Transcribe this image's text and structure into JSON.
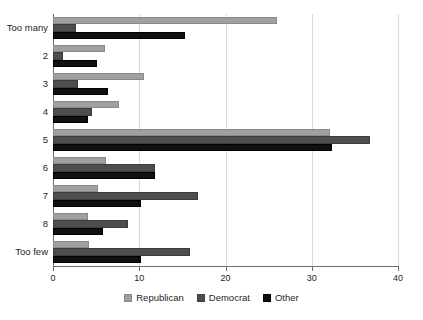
{
  "chart_data": {
    "type": "bar",
    "orientation": "horizontal",
    "grouped": true,
    "title": "",
    "subtitle": "",
    "xlabel": "",
    "ylabel": "",
    "xlim": [
      0,
      40
    ],
    "ylim": null,
    "grid": true,
    "grid_axis": "x",
    "legend_position": "bottom-center",
    "categories": [
      "Too many",
      "2",
      "3",
      "4",
      "5",
      "6",
      "7",
      "8",
      "Too few"
    ],
    "xticks": [
      0,
      10,
      20,
      30,
      40
    ],
    "xtick_labels": [
      "0",
      "10",
      "20",
      "30",
      "40"
    ],
    "series": [
      {
        "name": "Republican",
        "color": "#a0a0a0",
        "values": [
          26.0,
          6.0,
          10.5,
          7.7,
          32.1,
          6.1,
          5.2,
          4.1,
          4.2
        ]
      },
      {
        "name": "Democrat",
        "color": "#4d4d4d",
        "values": [
          2.7,
          1.2,
          2.9,
          4.5,
          36.7,
          11.8,
          16.8,
          8.7,
          15.9
        ]
      },
      {
        "name": "Other",
        "color": "#101010",
        "values": [
          15.3,
          5.1,
          6.4,
          4.1,
          32.4,
          11.8,
          10.2,
          5.8,
          10.2
        ]
      }
    ],
    "annotations": []
  },
  "axis": {
    "x_tick_labels": [
      "0",
      "10",
      "20",
      "30",
      "40"
    ],
    "y_tick_labels": [
      "Too many",
      "2",
      "3",
      "4",
      "5",
      "6",
      "7",
      "8",
      "Too few"
    ]
  },
  "legend": {
    "entries": [
      {
        "label": "Republican",
        "swatch": "legend-swatch-republican"
      },
      {
        "label": "Democrat",
        "swatch": "legend-swatch-democrat"
      },
      {
        "label": "Other",
        "swatch": "legend-swatch-other"
      }
    ]
  }
}
